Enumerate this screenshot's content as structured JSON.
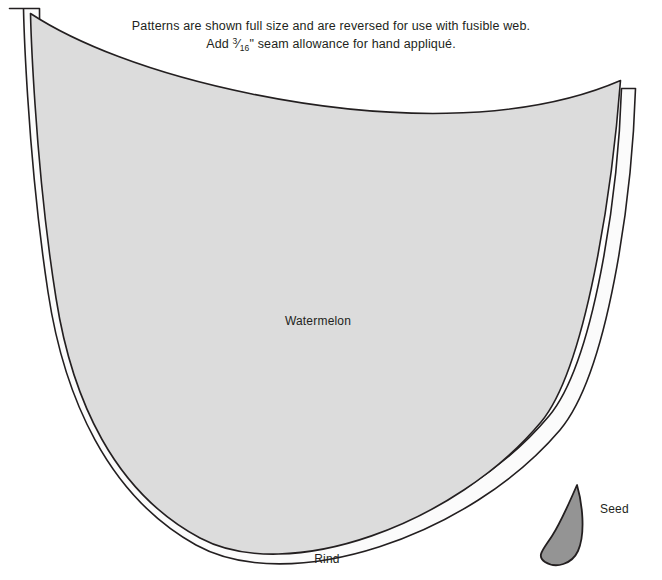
{
  "document": {
    "title": "Watermelon Appliqué Pattern",
    "type": "quilting-pattern-template"
  },
  "instructions": {
    "line1": "Patterns are shown full size and are reversed for use with fusible web.",
    "line2_prefix": "Add ",
    "line2_fraction_numerator": "3",
    "line2_fraction_denominator": "16",
    "line2_suffix": "\" seam allowance for hand appliqué.",
    "line2_full": "Add 3/16\" seam allowance for hand appliqué."
  },
  "pieces": [
    {
      "id": "watermelon",
      "label": "Watermelon",
      "fill": "#dcdcdc",
      "stroke": "#231f20"
    },
    {
      "id": "rind",
      "label": "Rind",
      "fill": "#fbfbfb",
      "stroke": "#231f20"
    },
    {
      "id": "seed",
      "label": "Seed",
      "fill": "#949494",
      "stroke": "#231f20"
    }
  ],
  "colors": {
    "background": "#ffffff",
    "outline": "#231f20",
    "watermelon_fill": "#dcdcdc",
    "rind_fill": "#fbfbfb",
    "seed_fill": "#949494",
    "text": "#221f20"
  }
}
